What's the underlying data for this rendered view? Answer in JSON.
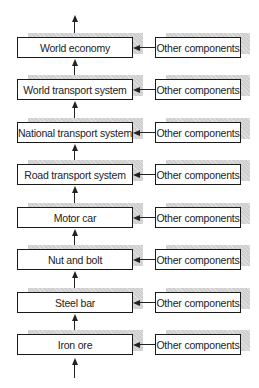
{
  "diagram": {
    "type": "hierarchy-flow",
    "levels": [
      {
        "label": "World economy",
        "input": "Other components"
      },
      {
        "label": "World transport system",
        "input": "Other components"
      },
      {
        "label": "National transport system",
        "input": "Other components"
      },
      {
        "label": "Road transport system",
        "input": "Other components"
      },
      {
        "label": "Motor car",
        "input": "Other components"
      },
      {
        "label": "Nut and bolt",
        "input": "Other components"
      },
      {
        "label": "Steel bar",
        "input": "Other components"
      },
      {
        "label": "Iron ore",
        "input": "Other components"
      }
    ],
    "colors": {
      "border": "#1a1a1a",
      "shadow": "#cfcfcf",
      "text": "#222222",
      "background": "#ffffff"
    }
  }
}
